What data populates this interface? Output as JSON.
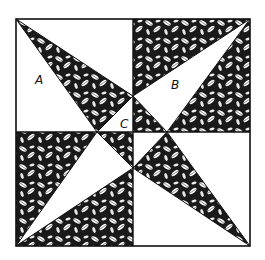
{
  "diagram": {
    "type": "quilt-block",
    "colors": {
      "background": "#ffffff",
      "line": "#111111",
      "light_fabric": "#ffffff",
      "dark_fabric": "#1a1a1a"
    },
    "labels": [
      {
        "id": "A",
        "text": "A",
        "x": 35,
        "y": 84
      },
      {
        "id": "B",
        "text": "B",
        "x": 171,
        "y": 89
      },
      {
        "id": "C",
        "text": "C",
        "x": 120,
        "y": 128
      }
    ],
    "pieces": {
      "A": "light large triangle",
      "B": "light long triangle",
      "C": "small corner triangle"
    }
  }
}
